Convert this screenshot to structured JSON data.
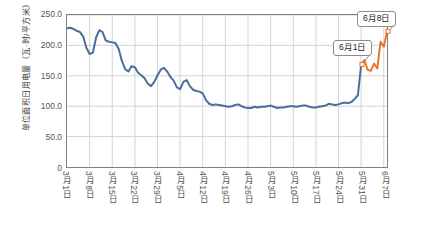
{
  "chart_data": {
    "type": "line",
    "title": "",
    "xlabel": "",
    "ylabel": "单位面积日用电量（瓦·时/平方米）",
    "ylim": [
      0,
      250
    ],
    "ytick_labels": [
      "0",
      "50.0",
      "100.0",
      "150.0",
      "200.0",
      "250.0"
    ],
    "ytick_values": [
      0,
      50,
      100,
      150,
      200,
      250
    ],
    "grid": "horizontal-and-vertical",
    "legend": "none",
    "x_start_label": "3月1日",
    "x_end_label": "6月8日",
    "xtick_labels": [
      "3月1日",
      "3月8日",
      "3月15日",
      "3月22日",
      "3月29日",
      "4月5日",
      "4月12日",
      "4月19日",
      "4月26日",
      "5月3日",
      "5月10日",
      "5月17日",
      "5月24日",
      "5月31日",
      "6月7日"
    ],
    "xtick_indices": [
      0,
      7,
      14,
      21,
      28,
      35,
      42,
      49,
      56,
      63,
      70,
      77,
      84,
      91,
      98
    ],
    "series": [
      {
        "name": "3月1日-5月31日",
        "color": "#4A6E9E",
        "start_index": 0,
        "values": [
          228,
          229,
          227,
          224,
          222,
          215,
          196,
          186,
          188,
          213,
          225,
          222,
          208,
          206,
          205,
          204,
          194,
          174,
          161,
          157,
          166,
          164,
          155,
          151,
          146,
          137,
          133,
          140,
          151,
          160,
          163,
          157,
          148,
          142,
          131,
          128,
          140,
          143,
          133,
          127,
          125,
          124,
          121,
          110,
          104,
          102,
          103,
          102,
          101,
          100,
          99,
          100,
          102,
          103,
          100,
          98,
          97,
          97,
          99,
          98,
          99,
          99,
          100,
          101,
          99,
          97,
          98,
          98,
          99,
          100,
          100,
          99,
          100,
          101,
          101,
          99,
          98,
          98,
          99,
          100,
          101,
          104,
          103,
          102,
          103,
          105,
          106,
          105,
          107,
          112,
          118,
          168
        ]
      },
      {
        "name": "6月1日-6月8日",
        "color": "#E8762C",
        "start_index": 91,
        "values": [
          168,
          176,
          160,
          158,
          170,
          162,
          206,
          198,
          222,
          221
        ]
      }
    ],
    "annotations": [
      {
        "label": "6月1日",
        "target_index": 91,
        "target_value": 168
      },
      {
        "label": "6月8日",
        "target_index": 99,
        "target_value": 222
      }
    ]
  },
  "style": {
    "line_color_primary": "#4A6E9E",
    "line_color_highlight": "#E8762C",
    "grid_color": "#D4D4D4",
    "axis_color": "#808080",
    "text_color": "#555555",
    "background": "#FFFFFF"
  }
}
